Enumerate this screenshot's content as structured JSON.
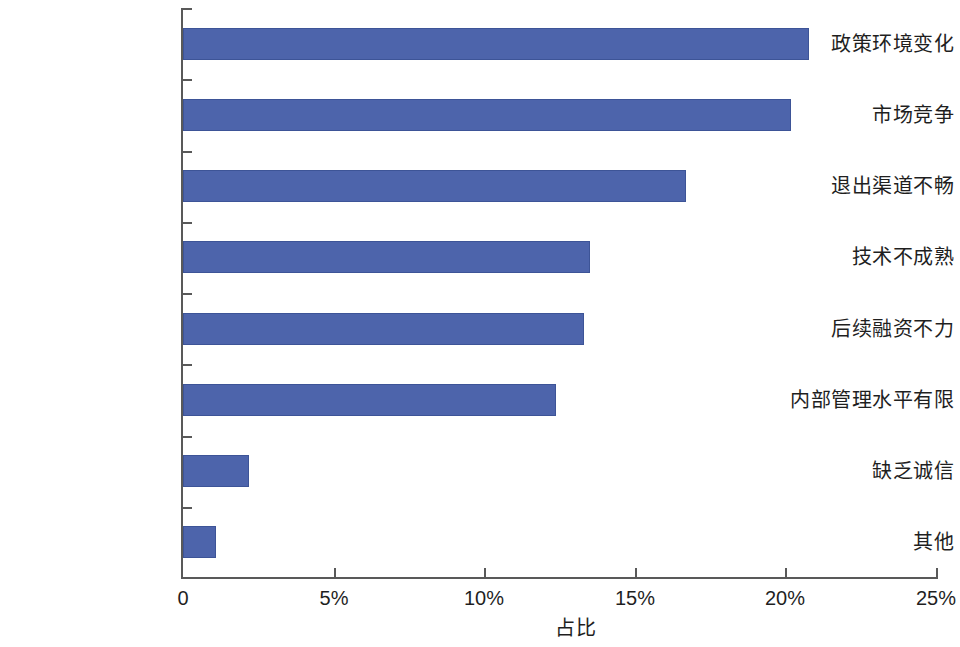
{
  "chart_data": {
    "type": "bar",
    "orientation": "horizontal",
    "title": "",
    "subtitle": "",
    "xlabel": "占比",
    "ylabel": "",
    "xlim": [
      0,
      25
    ],
    "xticks": [
      0,
      5,
      10,
      15,
      20,
      25
    ],
    "xtick_labels": [
      "0",
      "5%",
      "10%",
      "15%",
      "20%",
      "25%"
    ],
    "grid": false,
    "legend": null,
    "bar_color": "#4d64ab",
    "bar_edge_color": "#3d5497",
    "axis_color": "#595959",
    "categories": [
      "政策环境变化",
      "市场竞争",
      "退出渠道不畅",
      "技术不成熟",
      "后续融资不力",
      "内部管理水平有限",
      "缺乏诚信",
      "其他"
    ],
    "values": [
      20.8,
      20.2,
      16.7,
      13.5,
      13.3,
      12.4,
      2.2,
      1.1
    ],
    "value_labels": [
      "20.8%",
      "20.2%",
      "16.7%",
      "13.5%",
      "13.3%",
      "12.4%",
      "2.2%",
      "1.1%"
    ],
    "series": [
      {
        "name": "占比",
        "values": [
          20.8,
          20.2,
          16.7,
          13.5,
          13.3,
          12.4,
          2.2,
          1.1
        ]
      }
    ]
  }
}
